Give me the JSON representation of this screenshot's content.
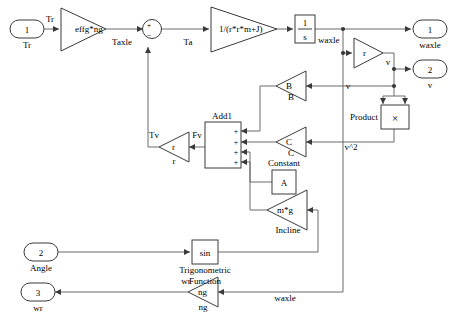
{
  "diagram": {
    "type": "simulink-block-diagram",
    "background": "#ffffff",
    "line_color": "#6b6b6b",
    "block_color": "#3a3a3a",
    "text_color": "#000000"
  },
  "inports": [
    {
      "id": "in1",
      "number": "1",
      "label": "Tr"
    },
    {
      "id": "in2",
      "number": "2",
      "label": "Angle"
    }
  ],
  "outports": [
    {
      "id": "out1",
      "number": "1",
      "label": "waxle"
    },
    {
      "id": "out2",
      "number": "2",
      "label": "v"
    },
    {
      "id": "out3",
      "number": "3",
      "label": "wr"
    }
  ],
  "gains": [
    {
      "id": "g_effg",
      "expr": "effg*ng",
      "caption": "",
      "dir": "right"
    },
    {
      "id": "g_tf",
      "expr": "1/(r*r*m+J)",
      "caption": "",
      "dir": "right"
    },
    {
      "id": "g_r_w",
      "expr": "r",
      "caption": "",
      "dir": "right"
    },
    {
      "id": "g_B",
      "expr": "B",
      "caption": "B",
      "dir": "left"
    },
    {
      "id": "g_C",
      "expr": "C",
      "caption": "C",
      "dir": "left"
    },
    {
      "id": "g_r_tv",
      "expr": "r",
      "caption": "r",
      "dir": "left"
    },
    {
      "id": "g_mg",
      "expr": "m*g",
      "caption": "Incline",
      "dir": "left"
    },
    {
      "id": "g_ng",
      "expr": "ng",
      "caption": "ng",
      "dir": "left"
    }
  ],
  "blocks": [
    {
      "id": "integrator",
      "kind": "integrator",
      "numerator": "1",
      "denominator": "s",
      "caption": ""
    },
    {
      "id": "constant",
      "kind": "constant",
      "value": "A",
      "caption": "Constant"
    },
    {
      "id": "product",
      "kind": "product",
      "symbol": "×",
      "caption": "Product"
    },
    {
      "id": "trig",
      "kind": "function",
      "value": "sin",
      "caption_line1": "Trigonometric",
      "caption_line2": "Function"
    },
    {
      "id": "sum",
      "kind": "sum",
      "caption": "",
      "signs": [
        "+",
        "−"
      ]
    },
    {
      "id": "add1",
      "kind": "adder",
      "caption": "Add1",
      "signs": [
        "+",
        "+",
        "+",
        "+"
      ]
    }
  ],
  "signal_labels": [
    {
      "id": "sig_tr",
      "text": "Tr"
    },
    {
      "id": "sig_taxle",
      "text": "Taxle"
    },
    {
      "id": "sig_ta",
      "text": "Ta"
    },
    {
      "id": "sig_waxle1",
      "text": "waxle"
    },
    {
      "id": "sig_v1",
      "text": "v"
    },
    {
      "id": "sig_v2",
      "text": "v"
    },
    {
      "id": "sig_v2sq",
      "text": "v^2"
    },
    {
      "id": "sig_tv",
      "text": "Tv"
    },
    {
      "id": "sig_fv",
      "text": "Fv"
    },
    {
      "id": "sig_wr",
      "text": "wr"
    },
    {
      "id": "sig_waxle2",
      "text": "waxle"
    }
  ]
}
